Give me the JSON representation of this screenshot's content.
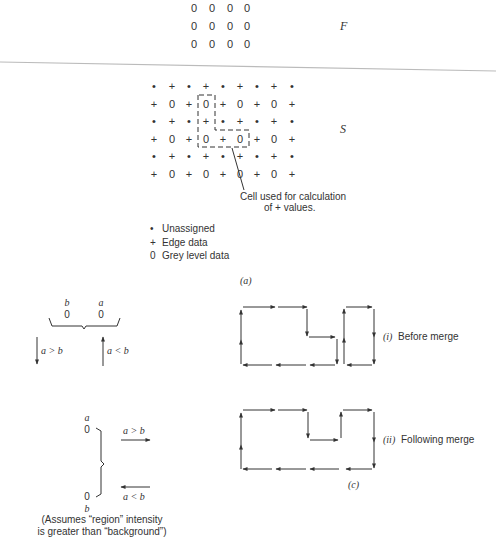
{
  "part_a": {
    "matrix_F": {
      "label": "F",
      "rows": [
        [
          "0",
          "0",
          "0",
          "0"
        ],
        [
          "0",
          "0",
          "0",
          "0"
        ],
        [
          "0",
          "0",
          "0",
          "0"
        ]
      ]
    },
    "matrix_S": {
      "label": "S",
      "rows": [
        [
          "•",
          "+",
          "•",
          "+",
          "•",
          "+",
          "•",
          "+",
          "•"
        ],
        [
          "+",
          "0",
          "+",
          "0",
          "+",
          "0",
          "+",
          "0",
          "+"
        ],
        [
          "•",
          "+",
          "•",
          "+",
          "•",
          "+",
          "•",
          "+",
          "•"
        ],
        [
          "+",
          "0",
          "+",
          "0",
          "+",
          "0",
          "+",
          "0",
          "+"
        ],
        [
          "•",
          "+",
          "•",
          "+",
          "•",
          "+",
          "•",
          "+",
          "•"
        ],
        [
          "+",
          "0",
          "+",
          "0",
          "+",
          "0",
          "+",
          "0",
          "+"
        ]
      ]
    },
    "callout": {
      "line1": "Cell used for calculation",
      "line2": "of + values."
    },
    "legend": [
      {
        "symbol": "•",
        "label": "Unassigned"
      },
      {
        "symbol": "+",
        "label": "Edge data"
      },
      {
        "symbol": "0",
        "label": "Grey level data"
      }
    ],
    "caption": "(a)"
  },
  "part_b": {
    "top": {
      "left_top": "b",
      "left_bottom": "0",
      "right_top": "a",
      "right_bottom": "0",
      "down_arrow_label": "a > b",
      "up_arrow_label": "a < b"
    },
    "side": {
      "upper_top": "a",
      "upper_bottom": "0",
      "lower_top": "0",
      "lower_bottom": "b",
      "right_arrow_label": "a > b",
      "left_arrow_label": "a < b"
    },
    "note_line1": "(Assumes “region” intensity",
    "note_line2": "is greater than “background”)",
    "caption": "(b)"
  },
  "part_c": {
    "before": {
      "numeral": "(i)",
      "label": "Before merge"
    },
    "after": {
      "numeral": "(ii)",
      "label": "Following merge"
    },
    "caption": "(c)"
  }
}
